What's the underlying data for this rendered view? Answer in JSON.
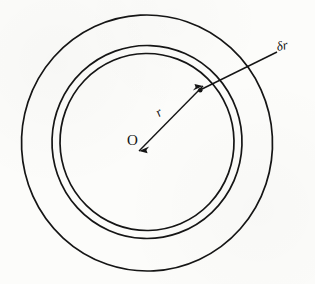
{
  "figure": {
    "type": "geometry-diagram",
    "background_color": "#fcfcfa",
    "ink_color": "#151515",
    "canvas": {
      "width": 315,
      "height": 284
    },
    "center": {
      "x": 147,
      "y": 143
    },
    "circles": [
      {
        "name": "outer-circle",
        "radius": 125,
        "stroke_width": 1.7
      },
      {
        "name": "shell-outer-circle",
        "radius": 95,
        "stroke_width": 1.7
      },
      {
        "name": "shell-inner-circle",
        "radius": 87,
        "stroke_width": 1.7
      }
    ],
    "labels": {
      "center_point": "O",
      "radius": "r",
      "shell_thickness": "δr"
    },
    "radius_arrow": {
      "name": "radius-double-arrow",
      "from": {
        "x": 139,
        "y": 151
      },
      "to": {
        "x": 202,
        "y": 87
      },
      "double_headed": true
    },
    "leader_line": {
      "name": "delta-r-leader",
      "from": {
        "x": 277,
        "y": 52
      },
      "to": {
        "x": 200,
        "y": 90
      }
    }
  }
}
